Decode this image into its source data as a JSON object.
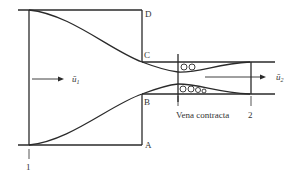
{
  "figure": {
    "colors": {
      "line": "#2a2a2a",
      "text": "#333333",
      "background": "#ffffff"
    },
    "labels": {
      "D": "D",
      "C": "C",
      "B": "B",
      "A": "A",
      "section1": "1",
      "section2": "2",
      "vena_contracta": "Vena contracta",
      "u1_base": "ū",
      "u1_sub": "1",
      "u2_base": "ū",
      "u2_sub": "2"
    },
    "elements": [
      "converging nozzle walls (upper and lower curves)",
      "tank/box outline ABCD",
      "outlet channel",
      "jet contraction with eddies",
      "velocity arrows u1 and u2",
      "section markers 1, vena contracta, 2"
    ]
  }
}
